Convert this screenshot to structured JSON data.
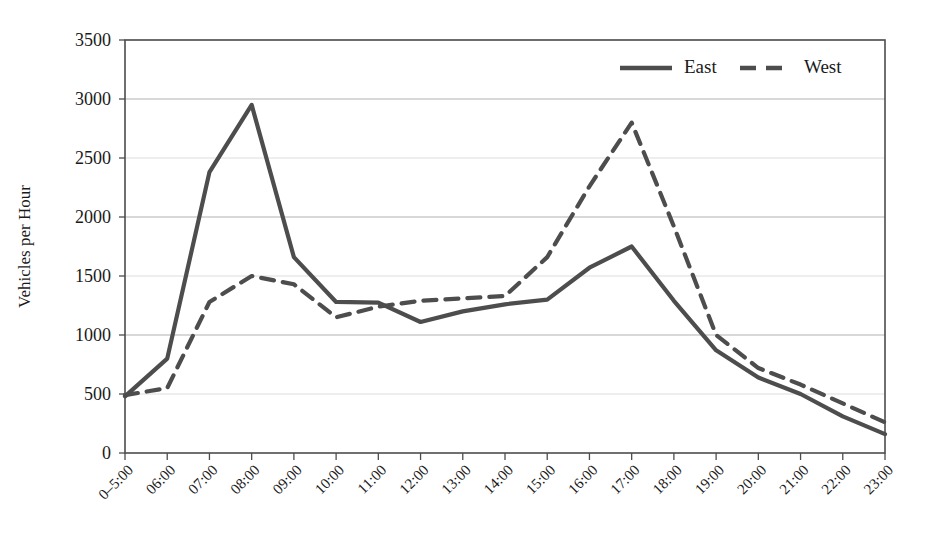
{
  "chart_data": {
    "type": "line",
    "title": "",
    "xlabel": "",
    "ylabel": "Vehicles per Hour",
    "ylim": [
      0,
      3500
    ],
    "ytick_step": 500,
    "grid": true,
    "legend_position": "top-right",
    "categories": [
      "0–5:00",
      "06:00",
      "07:00",
      "08:00",
      "09:00",
      "10:00",
      "11:00",
      "12:00",
      "13:00",
      "14:00",
      "15:00",
      "16:00",
      "17:00",
      "18:00",
      "19:00",
      "20:00",
      "21:00",
      "22:00",
      "23:00"
    ],
    "yticks": [
      0,
      500,
      1000,
      1500,
      2000,
      2500,
      3000,
      3500
    ],
    "ytick_labels": [
      "0",
      "500",
      "1000",
      "1500",
      "2000",
      "2500",
      "3000",
      "3500"
    ],
    "series": [
      {
        "name": "East",
        "style": "solid",
        "color": "#4d4d4d",
        "values": [
          480,
          800,
          2380,
          2950,
          1660,
          1280,
          1275,
          1110,
          1200,
          1260,
          1300,
          1570,
          1750,
          1290,
          870,
          640,
          500,
          310,
          160
        ]
      },
      {
        "name": "West",
        "style": "dashed",
        "color": "#4d4d4d",
        "values": [
          490,
          550,
          1280,
          1500,
          1430,
          1150,
          1240,
          1290,
          1310,
          1330,
          1660,
          2260,
          2800,
          1920,
          1000,
          720,
          580,
          420,
          260
        ]
      }
    ]
  },
  "legend": {
    "items": [
      {
        "label": "East",
        "style": "solid"
      },
      {
        "label": "West",
        "style": "dashed"
      }
    ]
  },
  "axes": {
    "y_title": "Vehicles per Hour"
  },
  "colors": {
    "line": "#4d4d4d",
    "frame": "#4d4d4d",
    "grid": "#9a9a9a",
    "background": "#ffffff",
    "text": "#1a1a1a"
  }
}
